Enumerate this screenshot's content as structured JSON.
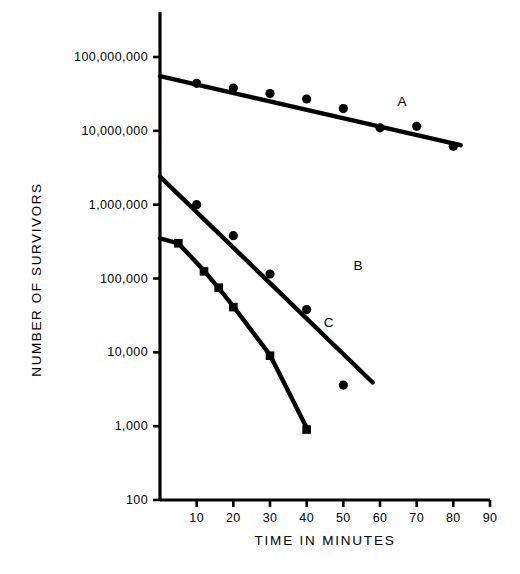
{
  "chart_data": {
    "type": "scatter",
    "title": "",
    "subtitle": "",
    "xlabel": "TIME IN MINUTES",
    "ylabel": "NUMBER OF SURVIVORS",
    "yscale": "log",
    "xscale": "linear",
    "xlim": [
      0,
      90
    ],
    "ylim": [
      100,
      100000000
    ],
    "grid": false,
    "legend_position": "inline-annotation",
    "x_ticks": [
      {
        "value": 10,
        "label": "10"
      },
      {
        "value": 20,
        "label": "20"
      },
      {
        "value": 30,
        "label": "30"
      },
      {
        "value": 40,
        "label": "40"
      },
      {
        "value": 50,
        "label": "50"
      },
      {
        "value": 60,
        "label": "60"
      },
      {
        "value": 70,
        "label": "70"
      },
      {
        "value": 80,
        "label": "80"
      },
      {
        "value": 90,
        "label": "90"
      }
    ],
    "y_ticks": [
      {
        "value": 100000000,
        "label": "100,000,000"
      },
      {
        "value": 10000000,
        "label": "10,000,000"
      },
      {
        "value": 1000000,
        "label": "1,000,000"
      },
      {
        "value": 100000,
        "label": "100,000"
      },
      {
        "value": 10000,
        "label": "10,000"
      },
      {
        "value": 1000,
        "label": "1,000"
      },
      {
        "value": 100,
        "label": "100"
      }
    ],
    "series": [
      {
        "name": "A",
        "label": "A",
        "label_x": 66,
        "label_y": 25000000,
        "marker": "filled-circle",
        "points": [
          {
            "x": 10,
            "y": 44000000
          },
          {
            "x": 20,
            "y": 38000000
          },
          {
            "x": 30,
            "y": 32000000
          },
          {
            "x": 40,
            "y": 27000000
          },
          {
            "x": 50,
            "y": 20000000
          },
          {
            "x": 60,
            "y": 11000000
          },
          {
            "x": 70,
            "y": 11500000
          },
          {
            "x": 80,
            "y": 6200000
          }
        ],
        "fit_line": [
          {
            "x": 0,
            "y": 55000000
          },
          {
            "x": 82,
            "y": 6400000
          }
        ]
      },
      {
        "name": "B",
        "label": "B",
        "label_x": 54,
        "label_y": 150000,
        "marker": "filled-circle",
        "points": [
          {
            "x": 10,
            "y": 1000000
          },
          {
            "x": 20,
            "y": 380000
          },
          {
            "x": 30,
            "y": 115000
          },
          {
            "x": 40,
            "y": 38000
          },
          {
            "x": 50,
            "y": 3600
          }
        ],
        "fit_line": [
          {
            "x": 0,
            "y": 2400000
          },
          {
            "x": 58,
            "y": 3900
          }
        ]
      },
      {
        "name": "C",
        "label": "C",
        "label_x": 46,
        "label_y": 26000,
        "marker": "filled-square",
        "points": [
          {
            "x": 5,
            "y": 300000
          },
          {
            "x": 12,
            "y": 125000
          },
          {
            "x": 16,
            "y": 75000
          },
          {
            "x": 20,
            "y": 41000
          },
          {
            "x": 30,
            "y": 9000
          },
          {
            "x": 40,
            "y": 900
          }
        ],
        "fit_line": [
          {
            "x": 0,
            "y": 350000
          },
          {
            "x": 5,
            "y": 300000
          },
          {
            "x": 12,
            "y": 128000
          },
          {
            "x": 16,
            "y": 74000
          },
          {
            "x": 20,
            "y": 42000
          },
          {
            "x": 30,
            "y": 9200
          },
          {
            "x": 40,
            "y": 950
          }
        ]
      }
    ],
    "colors": {
      "ink": "#000000",
      "background": "#ffffff"
    }
  }
}
